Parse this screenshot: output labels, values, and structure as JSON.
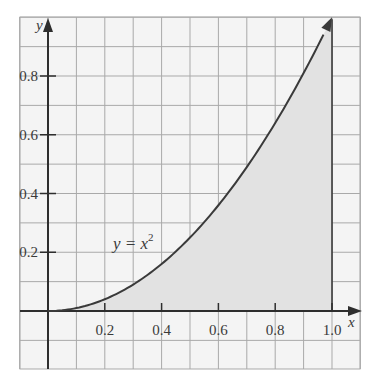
{
  "chart_data": {
    "type": "area",
    "title": "",
    "function": "y = x^2",
    "curve_label": "y = x",
    "curve_label_exponent": "2",
    "xlabel": "x",
    "ylabel": "y",
    "xlim": [
      -0.1,
      1.1
    ],
    "ylim": [
      -0.2,
      1.0
    ],
    "x_ticks": [
      0.2,
      0.4,
      0.6,
      0.8,
      1.0
    ],
    "x_tick_labels": [
      "0.2",
      "0.4",
      "0.6",
      "0.8",
      "1.0"
    ],
    "y_ticks": [
      0.2,
      0.4,
      0.6,
      0.8
    ],
    "y_tick_labels": [
      "0.2",
      "0.4",
      "0.6",
      "0.8"
    ],
    "grid": true,
    "grid_step": 0.1,
    "shaded_region": {
      "from_x": 0,
      "to_x": 1.0,
      "under": "y = x^2"
    },
    "series": [
      {
        "name": "y = x^2",
        "x": [
          0,
          0.1,
          0.2,
          0.3,
          0.4,
          0.5,
          0.6,
          0.7,
          0.8,
          0.9,
          1.0
        ],
        "values": [
          0,
          0.01,
          0.04,
          0.09,
          0.16,
          0.25,
          0.36,
          0.49,
          0.64,
          0.81,
          1.0
        ]
      }
    ],
    "colors": {
      "background": "#f4f4f4",
      "grid": "#a9a9a9",
      "shade": "#e2e2e2",
      "curve": "#3a3a3a",
      "axis": "#2e2e2e"
    }
  }
}
